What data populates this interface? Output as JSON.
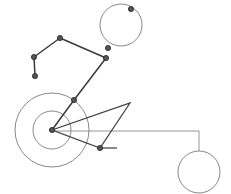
{
  "canvas": {
    "width": 231,
    "height": 194,
    "background": "#ffffff",
    "title": "Mechanical linkage line diagram"
  },
  "colors": {
    "circle_stroke": "#7a7a7a",
    "linkage_stroke": "#3a3a3a",
    "wedge_stroke": "#3a3a3a",
    "connector_stroke": "#8a8a8a",
    "node_fill": "#555555",
    "node_stroke": "#222222"
  },
  "strokes": {
    "circle_width": 0.9,
    "linkage_width": 1.5,
    "wedge_width": 1.2,
    "connector_width": 0.9,
    "tick_width": 1.2
  },
  "chart_data": {
    "type": "diagram",
    "xlabel": "",
    "ylabel": "",
    "xlim": [
      0,
      231
    ],
    "ylim": [
      0,
      194
    ],
    "grid": false,
    "legend": "none",
    "circles": [
      {
        "name": "hub-outer-circle",
        "cx": 52,
        "cy": 130,
        "r": 37
      },
      {
        "name": "hub-inner-circle",
        "cx": 52,
        "cy": 130,
        "r": 19
      },
      {
        "name": "top-circle",
        "cx": 121,
        "cy": 25,
        "r": 21
      },
      {
        "name": "bottom-right-circle",
        "cx": 199,
        "cy": 172,
        "r": 21
      }
    ],
    "linkage_chain": {
      "name": "linkage-polyline",
      "points": [
        [
          35,
          76
        ],
        [
          34,
          57
        ],
        [
          60,
          38
        ],
        [
          106,
          58
        ],
        [
          74,
          100
        ],
        [
          52,
          130
        ]
      ]
    },
    "nodes": [
      {
        "name": "node-chain-end",
        "cx": 35,
        "cy": 76
      },
      {
        "name": "node-chain-lower-left",
        "cx": 34,
        "cy": 57
      },
      {
        "name": "node-chain-apex",
        "cx": 60,
        "cy": 38
      },
      {
        "name": "node-chain-right",
        "cx": 106,
        "cy": 58
      },
      {
        "name": "node-chain-upper-joint",
        "cx": 108,
        "cy": 48
      },
      {
        "name": "node-chain-mid",
        "cx": 74,
        "cy": 100
      },
      {
        "name": "node-hub-center",
        "cx": 52,
        "cy": 130
      },
      {
        "name": "node-top-circle-marker",
        "cx": 131,
        "cy": 9
      },
      {
        "name": "node-wedge-base",
        "cx": 100,
        "cy": 148
      }
    ],
    "wedge": {
      "name": "wedge-triangle",
      "points": [
        [
          52,
          130
        ],
        [
          130,
          103
        ],
        [
          100,
          148
        ]
      ]
    },
    "connector_line": {
      "name": "horizontal-connector",
      "points": [
        [
          52,
          131
        ],
        [
          199,
          131
        ],
        [
          199,
          151
        ]
      ]
    },
    "tick_mark": {
      "name": "base-tick",
      "x1": 100,
      "y1": 148,
      "x2": 117,
      "y2": 148
    },
    "node_radius": 2.6
  }
}
